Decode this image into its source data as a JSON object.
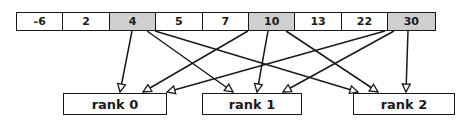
{
  "array": {
    "cells": [
      {
        "value": "-6",
        "highlighted": false
      },
      {
        "value": "2",
        "highlighted": false
      },
      {
        "value": "4",
        "highlighted": true
      },
      {
        "value": "5",
        "highlighted": false
      },
      {
        "value": "7",
        "highlighted": false
      },
      {
        "value": "10",
        "highlighted": true
      },
      {
        "value": "13",
        "highlighted": false
      },
      {
        "value": "22",
        "highlighted": false
      },
      {
        "value": "30",
        "highlighted": true
      }
    ]
  },
  "ranks": [
    {
      "label": "rank 0"
    },
    {
      "label": "rank 1"
    },
    {
      "label": "rank 2"
    }
  ],
  "arrows": [
    {
      "from": "4",
      "to": "rank 0"
    },
    {
      "from": "4",
      "to": "rank 1"
    },
    {
      "from": "4",
      "to": "rank 2"
    },
    {
      "from": "10",
      "to": "rank 0"
    },
    {
      "from": "10",
      "to": "rank 1"
    },
    {
      "from": "10",
      "to": "rank 2"
    },
    {
      "from": "30",
      "to": "rank 0"
    },
    {
      "from": "30",
      "to": "rank 1"
    },
    {
      "from": "30",
      "to": "rank 2"
    }
  ],
  "colors": {
    "line": "#1a1a1a",
    "highlight": "#cfcfcf",
    "background": "#ffffff"
  }
}
